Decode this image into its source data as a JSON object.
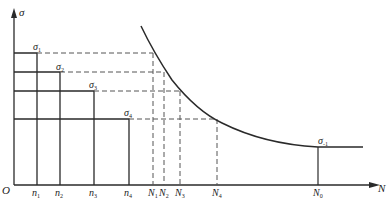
{
  "diagram": {
    "axes": {
      "y_label": "σ",
      "x_label": "N",
      "origin_label": "O"
    },
    "stress_levels": [
      {
        "id": "sigma1",
        "label": "σ",
        "sub": "1",
        "y": 53,
        "n_x": 37,
        "N_x": 153
      },
      {
        "id": "sigma2",
        "label": "σ",
        "sub": "2",
        "y": 72,
        "n_x": 60,
        "N_x": 164
      },
      {
        "id": "sigma3",
        "label": "σ",
        "sub": "3",
        "y": 91,
        "n_x": 94,
        "N_x": 180
      },
      {
        "id": "sigma4",
        "label": "σ",
        "sub": "4",
        "y": 119,
        "n_x": 129,
        "N_x": 217
      }
    ],
    "n_ticks": [
      {
        "label": "n",
        "sub": "1"
      },
      {
        "label": "n",
        "sub": "2"
      },
      {
        "label": "n",
        "sub": "3"
      },
      {
        "label": "n",
        "sub": "4"
      }
    ],
    "N_ticks": [
      {
        "label": "N",
        "sub": "1"
      },
      {
        "label": "N",
        "sub": "2"
      },
      {
        "label": "N",
        "sub": "3"
      },
      {
        "label": "N",
        "sub": "4"
      }
    ],
    "endurance": {
      "sigma_label": "σ",
      "sigma_sub": "-1",
      "N_label": "N",
      "N_sub": "0"
    },
    "colors": {
      "line": "#2a2a2a",
      "dashed": "#555555"
    }
  }
}
